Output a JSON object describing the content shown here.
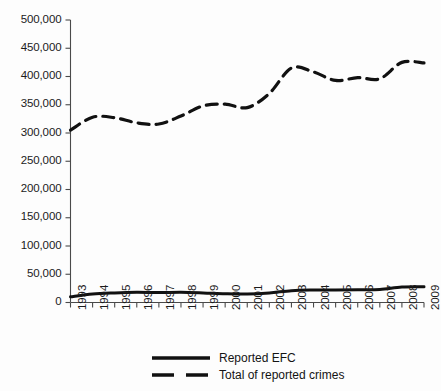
{
  "chart_data": {
    "type": "line",
    "title": "",
    "xlabel": "",
    "ylabel": "",
    "grid": false,
    "legend_position": "bottom",
    "categories": [
      "1993",
      "1994",
      "1995",
      "1996",
      "1997",
      "1998",
      "1999",
      "2000",
      "2001",
      "2002",
      "2003",
      "2004",
      "2005",
      "2006",
      "2007",
      "2008",
      "2009"
    ],
    "x": [
      1993,
      1994,
      1995,
      1996,
      1997,
      1998,
      1999,
      2000,
      2001,
      2002,
      2003,
      2004,
      2005,
      2006,
      2007,
      2008,
      2009
    ],
    "ylim": [
      0,
      500000
    ],
    "xlim": [
      1993,
      2009
    ],
    "yticks": [
      0,
      50000,
      100000,
      150000,
      200000,
      250000,
      300000,
      350000,
      400000,
      450000,
      500000
    ],
    "ytick_labels": [
      "0",
      "50,000",
      "100,000",
      "150,000",
      "200,000",
      "250,000",
      "300,000",
      "350,000",
      "400,000",
      "450,000",
      "500,000"
    ],
    "series": [
      {
        "name": "Reported EFC",
        "style": "solid",
        "color": "#111111",
        "values": [
          10000,
          15000,
          17000,
          18000,
          17500,
          18000,
          17000,
          15500,
          15000,
          17000,
          21000,
          22000,
          22000,
          22500,
          23000,
          27500,
          28000
        ]
      },
      {
        "name": "Total of reported crimes",
        "style": "dashed",
        "color": "#111111",
        "values": [
          305000,
          328000,
          327000,
          318000,
          316000,
          330000,
          348000,
          351000,
          345000,
          370000,
          415000,
          408000,
          393000,
          398000,
          396000,
          425000,
          424000
        ]
      }
    ]
  },
  "legend": {
    "items": [
      {
        "label": "Reported EFC",
        "style": "solid"
      },
      {
        "label": "Total of reported crimes",
        "style": "dashed"
      }
    ]
  },
  "axes": {
    "y_axis_name": "value-axis",
    "x_axis_name": "year-axis"
  }
}
